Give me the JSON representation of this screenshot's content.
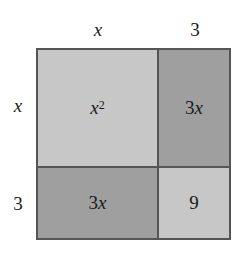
{
  "diagram": {
    "top_labels": [
      "x",
      "3"
    ],
    "side_labels": [
      "x",
      "3"
    ],
    "cells": [
      {
        "base": "x",
        "exp": "2",
        "shade": "light"
      },
      {
        "coef": "3",
        "var": "x",
        "shade": "dark"
      },
      {
        "coef": "3",
        "var": "x",
        "shade": "dark"
      },
      {
        "value": "9",
        "shade": "light"
      }
    ],
    "colors": {
      "light": "#c7c7c7",
      "dark": "#9f9f9f",
      "border": "#555555"
    }
  }
}
